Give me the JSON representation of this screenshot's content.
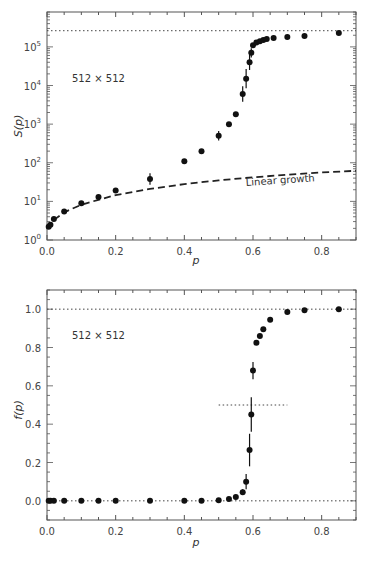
{
  "chart_data": [
    {
      "type": "scatter",
      "title": "",
      "xlabel": "p",
      "ylabel": "S(p)",
      "yscale": "log",
      "xlim": [
        0.0,
        0.9
      ],
      "ylim": [
        1,
        800000
      ],
      "x_ticks": [
        0.0,
        0.2,
        0.4,
        0.6,
        0.8
      ],
      "x_tick_labels": [
        "0.0",
        "0.2",
        "0.4",
        "0.6",
        "0.8"
      ],
      "y_ticks": [
        1,
        10,
        100,
        1000,
        10000,
        100000
      ],
      "y_tick_labels": [
        {
          "base": "10",
          "exp": "0"
        },
        {
          "base": "10",
          "exp": "1"
        },
        {
          "base": "10",
          "exp": "2"
        },
        {
          "base": "10",
          "exp": "3"
        },
        {
          "base": "10",
          "exp": "4"
        },
        {
          "base": "10",
          "exp": "5"
        }
      ],
      "grid": false,
      "annotation": "512 × 512",
      "reference_line": {
        "style": "dotted",
        "y": 262144,
        "label": ""
      },
      "curve": {
        "style": "dashed",
        "label": "Linear growth",
        "x": [
          0.0,
          0.01,
          0.02,
          0.05,
          0.1,
          0.15,
          0.2,
          0.3,
          0.4,
          0.5,
          0.6,
          0.7,
          0.8,
          0.9
        ],
        "y": [
          2.0,
          2.6,
          3.3,
          5.2,
          8.2,
          11.0,
          14.5,
          21,
          28,
          35,
          42,
          49,
          56,
          62
        ]
      },
      "series": [
        {
          "name": "S(p)",
          "x": [
            0.005,
            0.01,
            0.02,
            0.05,
            0.1,
            0.15,
            0.2,
            0.3,
            0.4,
            0.45,
            0.5,
            0.53,
            0.55,
            0.57,
            0.58,
            0.59,
            0.595,
            0.6,
            0.61,
            0.62,
            0.63,
            0.64,
            0.66,
            0.7,
            0.75,
            0.85
          ],
          "y": [
            2.2,
            2.5,
            3.5,
            5.5,
            9,
            13,
            19,
            38,
            110,
            200,
            500,
            1000,
            1800,
            6000,
            15000,
            40000,
            70000,
            110000,
            130000,
            140000,
            150000,
            160000,
            170000,
            180000,
            190000,
            230000
          ],
          "error_bars": [
            0,
            0,
            0,
            0,
            0,
            0,
            0,
            0.15,
            0,
            0,
            0.12,
            0,
            0,
            0.2,
            0.25,
            0.2,
            0.12,
            0,
            0,
            0,
            0,
            0,
            0,
            0,
            0,
            0
          ]
        }
      ]
    },
    {
      "type": "scatter",
      "title": "",
      "xlabel": "p",
      "ylabel": "f(p)",
      "xlim": [
        0.0,
        0.9
      ],
      "ylim": [
        -0.1,
        1.1
      ],
      "x_ticks": [
        0.0,
        0.2,
        0.4,
        0.6,
        0.8
      ],
      "x_tick_labels": [
        "0.0",
        "0.2",
        "0.4",
        "0.6",
        "0.8"
      ],
      "y_ticks": [
        0.0,
        0.2,
        0.4,
        0.6,
        0.8,
        1.0
      ],
      "y_tick_labels": [
        "0.0",
        "0.2",
        "0.4",
        "0.6",
        "0.8",
        "1.0"
      ],
      "grid": false,
      "annotation": "512 × 512",
      "reference_lines": [
        {
          "style": "dotted",
          "y": 1.0,
          "x_range": [
            0.0,
            0.9
          ]
        },
        {
          "style": "dotted",
          "y": 0.0,
          "x_range": [
            0.0,
            0.9
          ]
        },
        {
          "style": "dotted",
          "y": 0.5,
          "x_range": [
            0.5,
            0.7
          ]
        }
      ],
      "series": [
        {
          "name": "f(p)",
          "x": [
            0.005,
            0.01,
            0.02,
            0.05,
            0.1,
            0.15,
            0.2,
            0.3,
            0.4,
            0.45,
            0.5,
            0.53,
            0.55,
            0.57,
            0.58,
            0.59,
            0.595,
            0.6,
            0.61,
            0.62,
            0.63,
            0.65,
            0.7,
            0.75,
            0.85
          ],
          "y": [
            0.0,
            0.0,
            0.0,
            0.0,
            0.0,
            0.0,
            0.0,
            0.0,
            0.0,
            0.0,
            0.003,
            0.01,
            0.02,
            0.045,
            0.1,
            0.265,
            0.45,
            0.68,
            0.825,
            0.86,
            0.895,
            0.945,
            0.985,
            0.995,
            1.0
          ],
          "error_bars": [
            0,
            0,
            0,
            0,
            0,
            0,
            0,
            0,
            0,
            0,
            0,
            0,
            0,
            0.015,
            0.04,
            0.085,
            0.09,
            0.045,
            0,
            0,
            0,
            0,
            0,
            0,
            0
          ]
        }
      ]
    }
  ],
  "top_panel": {
    "ylabel": "S(p)",
    "xlabel": "p",
    "annotation": "512 × 512",
    "curve_label": "Linear growth"
  },
  "bottom_panel": {
    "ylabel": "f(p)",
    "xlabel": "p",
    "annotation": "512 × 512"
  }
}
